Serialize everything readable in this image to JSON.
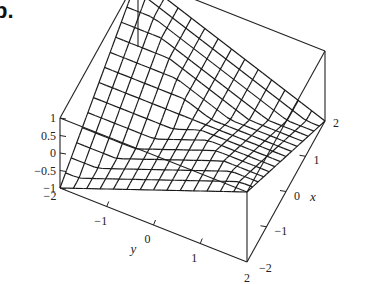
{
  "figure": {
    "label_fragment": "b."
  },
  "chart_data": {
    "type": "surface-wireframe",
    "title": "",
    "xlabel": "x",
    "ylabel": "y",
    "zlabel": "",
    "xlim": [
      -2,
      2
    ],
    "ylim": [
      -2,
      2
    ],
    "zlim": [
      -1,
      1
    ],
    "x_ticks": [
      -2,
      -1,
      0,
      1,
      2
    ],
    "x_tick_labels": [
      "−2",
      "−1",
      "0",
      "1",
      "2"
    ],
    "y_ticks": [
      -2,
      -1,
      0,
      1,
      2
    ],
    "y_tick_labels": [
      "−2",
      "−1",
      "0",
      "1",
      "2"
    ],
    "z_ticks": [
      1,
      0.5,
      0,
      -0.5,
      -1
    ],
    "z_tick_labels": [
      "1",
      "0.5",
      "0",
      "−0.5",
      "−1"
    ],
    "grid_lines_per_axis": 15,
    "surface_function": "z = (|x+y| - |x-y|)/4 approx sign-pattern saddle",
    "box": true
  }
}
